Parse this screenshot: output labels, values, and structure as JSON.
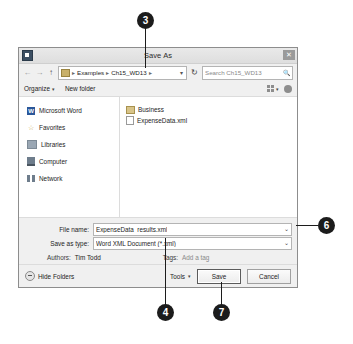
{
  "dialog": {
    "title": "Save As",
    "close_label": "✕",
    "window_icon": "window-icon"
  },
  "addressbar": {
    "back_label": "←",
    "forward_label": "→",
    "up_label": "↑",
    "separator": "▸",
    "crumbs": [
      "Examples",
      "Ch15_WD13"
    ],
    "dropdown_caret": "▾",
    "refresh_label": "↻",
    "search_value": "Search Ch15_WD13",
    "search_icon": "🔍"
  },
  "toolbar": {
    "organize_label": "Organize",
    "organize_caret": "▾",
    "new_folder_label": "New folder",
    "view_caret": "▾"
  },
  "navpane": {
    "items": [
      {
        "label": "Microsoft Word",
        "icon": "word-icon",
        "glyph": "W"
      },
      {
        "label": "Favorites",
        "icon": "star-icon",
        "glyph": "☆"
      },
      {
        "label": "Libraries",
        "icon": "libraries-icon"
      },
      {
        "label": "Computer",
        "icon": "computer-icon"
      },
      {
        "label": "Network",
        "icon": "network-icon"
      }
    ]
  },
  "filelist": {
    "items": [
      {
        "name": "Business",
        "type": "folder"
      },
      {
        "name": "ExpenseData.xml",
        "type": "xml"
      }
    ]
  },
  "form": {
    "filename_label": "File name:",
    "filename_value": "ExpenseData_results.xml",
    "savetype_label": "Save as type:",
    "savetype_value": "Word XML Document (*.xml)",
    "savetype_caret": "⌄",
    "filename_caret": "⌄",
    "authors_label": "Authors:",
    "authors_value": "Tim Todd",
    "tags_label": "Tags:",
    "tags_value": "Add a tag"
  },
  "footer": {
    "hide_folders_label": "Hide Folders",
    "tools_label": "Tools",
    "tools_caret": "▾",
    "save_label": "Save",
    "cancel_label": "Cancel"
  },
  "callouts": [
    {
      "number": "3"
    },
    {
      "number": "6"
    },
    {
      "number": "4"
    },
    {
      "number": "7"
    }
  ]
}
